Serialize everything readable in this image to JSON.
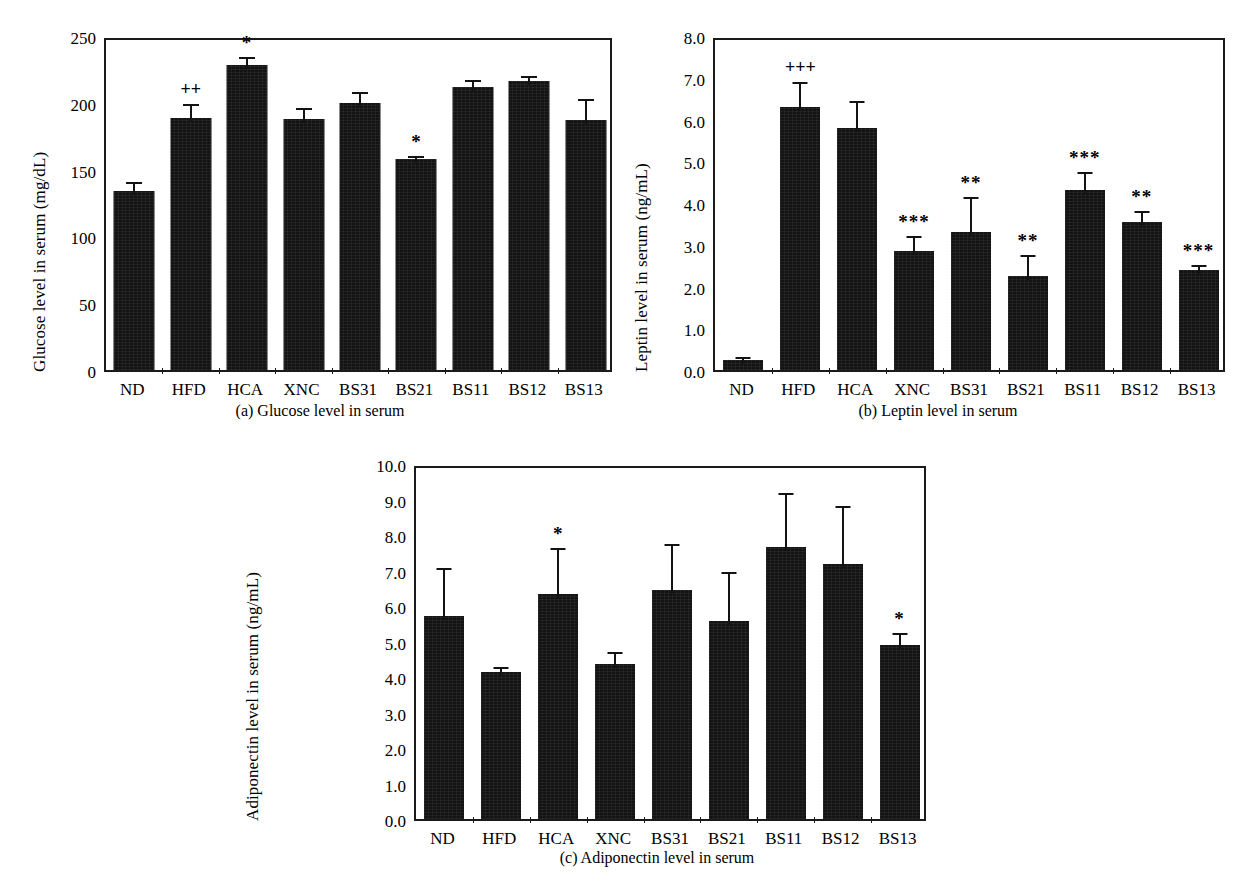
{
  "figure": {
    "background": "#ffffff",
    "ink_color": "#131313"
  },
  "chart_data": [
    {
      "id": "a",
      "type": "bar",
      "title": "",
      "subcaption": "(a)  Glucose level in serum",
      "xlabel": "",
      "ylabel": "Glucose level in serum (mg/dL)",
      "ylim": [
        0,
        250
      ],
      "ytick_values": [
        0,
        50,
        100,
        150,
        200,
        250
      ],
      "ytick_labels": [
        "0",
        "50",
        "100",
        "150",
        "200",
        "250"
      ],
      "grid": false,
      "legend": "none",
      "categories": [
        "ND",
        "HFD",
        "HCA",
        "XNC",
        "BS31",
        "BS21",
        "BS11",
        "BS12",
        "BS13"
      ],
      "values": [
        134,
        189,
        228,
        188,
        200,
        158,
        212,
        216,
        187
      ],
      "errors": [
        10,
        13,
        9,
        11,
        11,
        5,
        8,
        7,
        19
      ],
      "annotations": [
        "",
        "++",
        "*",
        "",
        "",
        "*",
        "",
        "",
        ""
      ]
    },
    {
      "id": "b",
      "type": "bar",
      "title": "",
      "subcaption": "(b)  Leptin level in serum",
      "xlabel": "",
      "ylabel": "Leptin level in serum (ng/mL)",
      "ylim": [
        0.0,
        8.0
      ],
      "ytick_values": [
        0.0,
        1.0,
        2.0,
        3.0,
        4.0,
        5.0,
        6.0,
        7.0,
        8.0
      ],
      "ytick_labels": [
        "0.0",
        "1.0",
        "2.0",
        "3.0",
        "4.0",
        "5.0",
        "6.0",
        "7.0",
        "8.0"
      ],
      "grid": false,
      "legend": "none",
      "categories": [
        "ND",
        "HFD",
        "HCA",
        "XNC",
        "BS31",
        "BS21",
        "BS11",
        "BS12",
        "BS13"
      ],
      "values": [
        0.25,
        6.3,
        5.8,
        2.85,
        3.3,
        2.25,
        4.3,
        3.55,
        2.4
      ],
      "errors": [
        0.15,
        0.7,
        0.75,
        0.45,
        0.95,
        0.6,
        0.55,
        0.35,
        0.2
      ],
      "annotations": [
        "",
        "+++",
        "",
        "***",
        "**",
        "**",
        "***",
        "**",
        "***"
      ]
    },
    {
      "id": "c",
      "type": "bar",
      "title": "",
      "subcaption": "(c)  Adiponectin level in serum",
      "xlabel": "",
      "ylabel": "Adiponectin level in serum (ng/mL)",
      "ylim": [
        0.0,
        10.0
      ],
      "ytick_values": [
        0.0,
        1.0,
        2.0,
        3.0,
        4.0,
        5.0,
        6.0,
        7.0,
        8.0,
        9.0,
        10.0
      ],
      "ytick_labels": [
        "0.0",
        "1.0",
        "2.0",
        "3.0",
        "4.0",
        "5.0",
        "6.0",
        "7.0",
        "8.0",
        "9.0",
        "10.0"
      ],
      "grid": false,
      "legend": "none",
      "categories": [
        "ND",
        "HFD",
        "HCA",
        "XNC",
        "BS31",
        "BS21",
        "BS11",
        "BS12",
        "BS13"
      ],
      "values": [
        5.72,
        4.15,
        6.35,
        4.38,
        6.45,
        5.58,
        7.65,
        7.18,
        4.9
      ],
      "errors": [
        1.45,
        0.25,
        1.4,
        0.45,
        1.4,
        1.5,
        1.65,
        1.75,
        0.45
      ],
      "annotations": [
        "",
        "",
        "*",
        "",
        "",
        "",
        "",
        "",
        "*"
      ]
    }
  ]
}
